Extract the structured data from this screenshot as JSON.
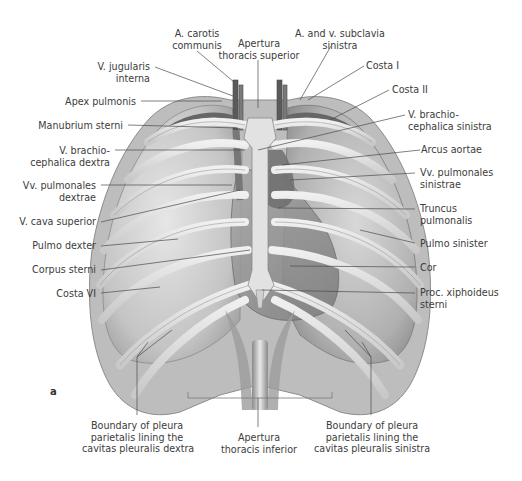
{
  "figure": {
    "panel_label": "a",
    "colors": {
      "background": "#ffffff",
      "label_text": "#3c3c3c",
      "leader_line": "#4a4a4a",
      "bone": "#d9d9d9",
      "lung": "#bfbfbf",
      "heart": "#8f8f8f",
      "vessel": "#6e6e6e"
    }
  },
  "labels": {
    "top": [
      {
        "id": "a-carotis-communis",
        "lines": [
          "A. carotis",
          "communis"
        ]
      },
      {
        "id": "apertura-thoracis-superior",
        "lines": [
          "Apertura",
          "thoracis superior"
        ]
      },
      {
        "id": "a-v-subclavia-sinistra",
        "lines": [
          "A. and v. subclavia",
          "sinistra"
        ]
      }
    ],
    "left": [
      {
        "id": "v-jugularis-interna",
        "lines": [
          "V. jugularis",
          "interna"
        ]
      },
      {
        "id": "apex-pulmonis",
        "lines": [
          "Apex pulmonis"
        ]
      },
      {
        "id": "manubrium-sterni",
        "lines": [
          "Manubrium sterni"
        ]
      },
      {
        "id": "v-brachiocephalica-dextra",
        "lines": [
          "V. brachio-",
          "cephalica dextra"
        ]
      },
      {
        "id": "vv-pulmonales-dextrae",
        "lines": [
          "Vv. pulmonales",
          "dextrae"
        ]
      },
      {
        "id": "v-cava-superior",
        "lines": [
          "V. cava superior"
        ]
      },
      {
        "id": "pulmo-dexter",
        "lines": [
          "Pulmo dexter"
        ]
      },
      {
        "id": "corpus-sterni",
        "lines": [
          "Corpus sterni"
        ]
      },
      {
        "id": "costa-vi",
        "lines": [
          "Costa VI"
        ]
      }
    ],
    "right": [
      {
        "id": "costa-i",
        "lines": [
          "Costa I"
        ]
      },
      {
        "id": "costa-ii",
        "lines": [
          "Costa II"
        ]
      },
      {
        "id": "v-brachiocephalica-sinistra",
        "lines": [
          "V. brachio-",
          "cephalica sinistra"
        ]
      },
      {
        "id": "arcus-aortae",
        "lines": [
          "Arcus aortae"
        ]
      },
      {
        "id": "vv-pulmonales-sinistrae",
        "lines": [
          "Vv. pulmonales",
          "sinistrae"
        ]
      },
      {
        "id": "truncus-pulmonalis",
        "lines": [
          "Truncus",
          "pulmonalis"
        ]
      },
      {
        "id": "pulmo-sinister",
        "lines": [
          "Pulmo sinister"
        ]
      },
      {
        "id": "cor",
        "lines": [
          "Cor"
        ]
      },
      {
        "id": "proc-xiphoideus-sterni",
        "lines": [
          "Proc. xiphoideus",
          "sterni"
        ]
      }
    ],
    "bottom": [
      {
        "id": "boundary-pleura-dextra",
        "lines": [
          "Boundary of pleura",
          "parietalis lining the",
          "cavitas pleuralis dextra"
        ]
      },
      {
        "id": "apertura-thoracis-inferior",
        "lines": [
          "Apertura",
          "thoracis inferior"
        ]
      },
      {
        "id": "boundary-pleura-sinistra",
        "lines": [
          "Boundary of pleura",
          "parietalis lining the",
          "cavitas pleuralis sinistra"
        ]
      }
    ]
  }
}
